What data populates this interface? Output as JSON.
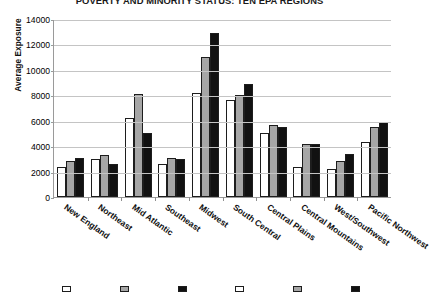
{
  "chart_data": {
    "type": "bar",
    "title": "POVERTY AND MINORITY STATUS: TEN EPA REGIONS",
    "xlabel": "",
    "ylabel": "Average Exposure",
    "ylim": [
      0,
      14000
    ],
    "ytick_interval": 2000,
    "yticks": [
      "14000",
      "12000",
      "10000",
      "8000",
      "6000",
      "4000",
      "2000",
      "0"
    ],
    "grid": true,
    "legend_position": "bottom",
    "categories": [
      "New England",
      "Northeast",
      "Mid Atlantic",
      "Southeast",
      "Midwest",
      "South Central",
      "Central Plains",
      "Central Mountains",
      "West/Southwest",
      "Pacific Northwest"
    ],
    "series": [
      {
        "name": "Series 1",
        "color": "#ffffff",
        "values": [
          2400,
          3000,
          6200,
          2600,
          8200,
          7600,
          5000,
          2400,
          2200,
          4300
        ]
      },
      {
        "name": "Series 2",
        "color": "#a6a6a6",
        "values": [
          2800,
          3300,
          8100,
          3100,
          11000,
          8000,
          5700,
          4200,
          2800,
          5500
        ]
      },
      {
        "name": "Series 3",
        "color": "#111111",
        "values": [
          3100,
          2600,
          5000,
          3000,
          12900,
          8900,
          5500,
          4200,
          3400,
          5900
        ]
      }
    ]
  },
  "legend": {
    "items": [
      {
        "label": "",
        "series": 0
      },
      {
        "label": "",
        "series": 1
      },
      {
        "label": "",
        "series": 2
      },
      {
        "label": "",
        "series": 0
      },
      {
        "label": "",
        "series": 1
      },
      {
        "label": "",
        "series": 2
      }
    ]
  }
}
